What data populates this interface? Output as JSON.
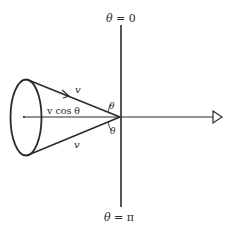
{
  "diagram": {
    "type": "cone-angle-diagram",
    "labels": {
      "top_axis": "θ = 0",
      "bottom_axis": "π",
      "bottom_axis_prefix": "θ = ",
      "top_axis_prefix": "θ = ",
      "top_axis_value": "0",
      "upper_edge": "v",
      "lower_edge": "v",
      "projection": "v cos θ",
      "upper_angle": "θ",
      "lower_angle": "θ"
    },
    "colors": {
      "ink": "#2a2a2a",
      "background": "#ffffff"
    },
    "elements": [
      "vertical-axis",
      "horizontal-axis-with-hollow-arrow",
      "cone-base-ellipse",
      "cone-upper-edge-with-arrow",
      "cone-lower-edge",
      "angle-arc-upper",
      "angle-arc-lower"
    ]
  }
}
